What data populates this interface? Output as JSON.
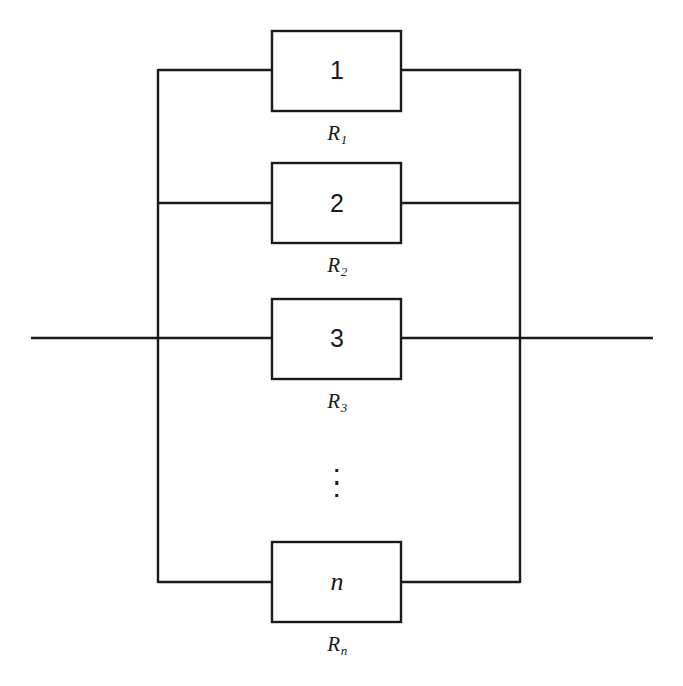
{
  "figure": {
    "caption": "",
    "background_color": "#ffffff",
    "line_color": "#1a1a1a",
    "geometry": {
      "width": 683,
      "height": 686,
      "left_bus_x": 158,
      "right_bus_x": 520,
      "box_left_x": 272,
      "box_right_x": 401,
      "left_terminal_x": 31,
      "right_terminal_x": 653,
      "main_line_y": 338,
      "bus_top_y": 70,
      "bus_bottom_y": 582,
      "box_height": 80
    }
  },
  "resistors": [
    {
      "id": "resistor-1",
      "number": "1",
      "number_style": "upright",
      "label_text": "R",
      "label_subscript": "1",
      "branch_y": 70,
      "box_top_y": 31,
      "label_y": 121
    },
    {
      "id": "resistor-2",
      "number": "2",
      "number_style": "upright",
      "label_text": "R",
      "label_subscript": "2",
      "branch_y": 203,
      "box_top_y": 163,
      "label_y": 253
    },
    {
      "id": "resistor-3",
      "number": "3",
      "number_style": "upright",
      "label_text": "R",
      "label_subscript": "3",
      "branch_y": 338,
      "box_top_y": 299,
      "label_y": 389
    },
    {
      "id": "resistor-n",
      "number": "n",
      "number_style": "italic",
      "label_text": "R",
      "label_subscript": "n",
      "branch_y": 582,
      "box_top_y": 542,
      "label_y": 632
    }
  ],
  "ellipsis": {
    "name": "vertical-ellipsis",
    "x": 337,
    "top_y": 469,
    "height": 28,
    "dot_count": 3
  },
  "terminals": {
    "left_label": "",
    "right_label": ""
  }
}
